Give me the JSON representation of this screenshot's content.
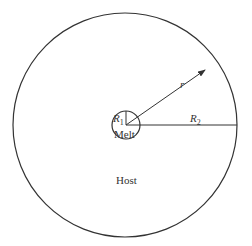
{
  "diagram": {
    "type": "concentric-circles",
    "labels": {
      "inner_region": "Melt",
      "outer_region": "Host",
      "inner_radius": "R",
      "inner_radius_sub": "1",
      "outer_radius": "R",
      "outer_radius_sub": "2",
      "radial_variable": "r"
    },
    "geometry": {
      "center": [
        125,
        125
      ],
      "outer_radius_px": 112,
      "inner_radius_px": 14
    },
    "colors": {
      "stroke": "#333333",
      "background": "#ffffff"
    }
  }
}
